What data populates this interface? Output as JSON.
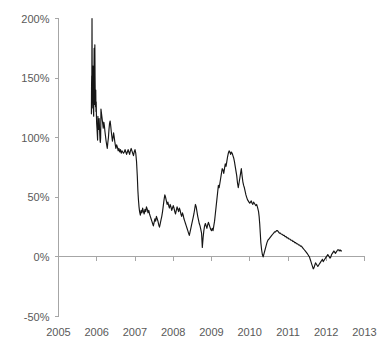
{
  "chart_data": {
    "type": "line",
    "title": "",
    "subtitle": "",
    "xlabel": "",
    "ylabel": "",
    "grid": false,
    "legend": "none",
    "legend_entries": [],
    "annotations": [],
    "line_color": "#161616",
    "axis_color": "#a6a6a6",
    "tick_label_color": "#595959",
    "xlim": [
      2005,
      2013
    ],
    "ylim": [
      -50,
      200
    ],
    "y_ticks": [
      -50,
      0,
      50,
      100,
      150,
      200
    ],
    "y_tick_labels": [
      "-50%",
      "0%",
      "50%",
      "100%",
      "150%",
      "200%"
    ],
    "x_ticks": [
      2005,
      2006,
      2007,
      2008,
      2009,
      2010,
      2011,
      2012,
      2013
    ],
    "x_tick_labels": [
      "2005",
      "2006",
      "2007",
      "2008",
      "2009",
      "2010",
      "2011",
      "2012",
      "2013"
    ],
    "series": [
      {
        "name": "spread",
        "x": [
          2005.86,
          2005.864,
          2005.868,
          2005.872,
          2005.876,
          2005.88,
          2005.884,
          2005.89,
          2005.896,
          2005.902,
          2005.908,
          2005.914,
          2005.92,
          2005.926,
          2005.932,
          2005.938,
          2005.944,
          2005.95,
          2005.956,
          2005.962,
          2005.968,
          2005.974,
          2005.98,
          2005.986,
          2005.992,
          2005.998,
          2006.006,
          2006.014,
          2006.022,
          2006.03,
          2006.038,
          2006.046,
          2006.054,
          2006.062,
          2006.07,
          2006.078,
          2006.086,
          2006.094,
          2006.102,
          2006.11,
          2006.125,
          2006.14,
          2006.155,
          2006.17,
          2006.185,
          2006.2,
          2006.215,
          2006.23,
          2006.245,
          2006.26,
          2006.275,
          2006.29,
          2006.305,
          2006.32,
          2006.335,
          2006.35,
          2006.365,
          2006.38,
          2006.395,
          2006.41,
          2006.425,
          2006.44,
          2006.455,
          2006.47,
          2006.485,
          2006.5,
          2006.52,
          2006.54,
          2006.56,
          2006.58,
          2006.6,
          2006.62,
          2006.64,
          2006.66,
          2006.68,
          2006.7,
          2006.72,
          2006.74,
          2006.76,
          2006.78,
          2006.8,
          2006.82,
          2006.84,
          2006.86,
          2006.88,
          2006.9,
          2006.92,
          2006.94,
          2006.96,
          2006.98,
          2007.0,
          2007.02,
          2007.04,
          2007.06,
          2007.075,
          2007.09,
          2007.105,
          2007.12,
          2007.14,
          2007.16,
          2007.18,
          2007.2,
          2007.22,
          2007.24,
          2007.26,
          2007.28,
          2007.3,
          2007.32,
          2007.34,
          2007.36,
          2007.38,
          2007.4,
          2007.42,
          2007.44,
          2007.46,
          2007.48,
          2007.5,
          2007.52,
          2007.54,
          2007.56,
          2007.58,
          2007.6,
          2007.62,
          2007.64,
          2007.66,
          2007.68,
          2007.7,
          2007.72,
          2007.74,
          2007.76,
          2007.78,
          2007.8,
          2007.82,
          2007.84,
          2007.86,
          2007.88,
          2007.9,
          2007.92,
          2007.94,
          2007.96,
          2007.98,
          2008.0,
          2008.02,
          2008.04,
          2008.06,
          2008.08,
          2008.1,
          2008.12,
          2008.14,
          2008.16,
          2008.18,
          2008.2,
          2008.22,
          2008.24,
          2008.26,
          2008.28,
          2008.3,
          2008.32,
          2008.34,
          2008.36,
          2008.38,
          2008.4,
          2008.42,
          2008.44,
          2008.46,
          2008.48,
          2008.5,
          2008.52,
          2008.54,
          2008.56,
          2008.58,
          2008.6,
          2008.62,
          2008.64,
          2008.66,
          2008.68,
          2008.7,
          2008.72,
          2008.74,
          2008.76,
          2008.78,
          2008.8,
          2008.82,
          2008.84,
          2008.86,
          2008.88,
          2008.9,
          2008.92,
          2008.94,
          2008.96,
          2008.98,
          2009.0,
          2009.02,
          2009.04,
          2009.06,
          2009.08,
          2009.1,
          2009.12,
          2009.14,
          2009.16,
          2009.18,
          2009.2,
          2009.22,
          2009.24,
          2009.26,
          2009.28,
          2009.3,
          2009.32,
          2009.34,
          2009.36,
          2009.38,
          2009.4,
          2009.42,
          2009.44,
          2009.46,
          2009.48,
          2009.5,
          2009.52,
          2009.54,
          2009.56,
          2009.58,
          2009.6,
          2009.62,
          2009.64,
          2009.66,
          2009.68,
          2009.7,
          2009.72,
          2009.74,
          2009.76,
          2009.78,
          2009.8,
          2009.82,
          2009.84,
          2009.86,
          2009.88,
          2009.9,
          2009.92,
          2009.94,
          2009.96,
          2009.98,
          2010.0,
          2010.02,
          2010.04,
          2010.06,
          2010.08,
          2010.1,
          2010.12,
          2010.14,
          2010.16,
          2010.18,
          2010.2,
          2010.215,
          2010.23,
          2010.245,
          2010.26,
          2010.275,
          2010.29,
          2010.31,
          2010.33,
          2010.35,
          2010.375,
          2010.4,
          2010.425,
          2010.45,
          2010.475,
          2010.5,
          2010.525,
          2010.55,
          2010.575,
          2010.6,
          2010.625,
          2010.65,
          2010.675,
          2010.7,
          2010.725,
          2010.75,
          2010.775,
          2010.8,
          2010.825,
          2010.85,
          2010.875,
          2010.9,
          2010.925,
          2010.95,
          2010.975,
          2011.0,
          2011.025,
          2011.05,
          2011.075,
          2011.1,
          2011.125,
          2011.15,
          2011.175,
          2011.2,
          2011.225,
          2011.25,
          2011.275,
          2011.3,
          2011.325,
          2011.35,
          2011.375,
          2011.4,
          2011.425,
          2011.45,
          2011.475,
          2011.5,
          2011.52,
          2011.54,
          2011.56,
          2011.58,
          2011.6,
          2011.62,
          2011.64,
          2011.66,
          2011.68,
          2011.7,
          2011.72,
          2011.74,
          2011.76,
          2011.78,
          2011.8,
          2011.82,
          2011.84,
          2011.86,
          2011.88,
          2011.9,
          2011.92,
          2011.94,
          2011.96,
          2011.98,
          2012.0,
          2012.02,
          2012.04,
          2012.06,
          2012.08,
          2012.1,
          2012.12,
          2012.14,
          2012.16,
          2012.18,
          2012.2,
          2012.22,
          2012.24,
          2012.26,
          2012.28,
          2012.3,
          2012.32,
          2012.34,
          2012.36,
          2012.38,
          2012.4
        ],
        "values": [
          120,
          143,
          152,
          148,
          200,
          160,
          150,
          131,
          125,
          160,
          133,
          122,
          118,
          150,
          175,
          140,
          128,
          178,
          150,
          132,
          126,
          140,
          122,
          130,
          118,
          112,
          108,
          103,
          98,
          118,
          110,
          107,
          112,
          116,
          110,
          104,
          98,
          96,
          100,
          124,
          120,
          116,
          112,
          108,
          113,
          110,
          105,
          101,
          97,
          94,
          91,
          96,
          100,
          107,
          112,
          114,
          110,
          105,
          101,
          97,
          100,
          104,
          101,
          97,
          94,
          91,
          94,
          92,
          89,
          91,
          88,
          90,
          87,
          89,
          88,
          87,
          88,
          90,
          88,
          86,
          88,
          90,
          88,
          86,
          89,
          91,
          89,
          87,
          85,
          88,
          90,
          87,
          80,
          68,
          56,
          48,
          42,
          38,
          35,
          39,
          37,
          41,
          38,
          36,
          40,
          38,
          42,
          40,
          37,
          39,
          36,
          34,
          32,
          30,
          28,
          26,
          29,
          32,
          30,
          34,
          32,
          30,
          27,
          25,
          28,
          31,
          34,
          38,
          43,
          48,
          52,
          50,
          47,
          44,
          46,
          43,
          41,
          44,
          42,
          39,
          41,
          43,
          41,
          38,
          36,
          39,
          42,
          40,
          38,
          41,
          39,
          36,
          34,
          37,
          35,
          32,
          30,
          28,
          26,
          24,
          22,
          20,
          18,
          21,
          24,
          27,
          30,
          33,
          36,
          40,
          44,
          42,
          38,
          34,
          31,
          28,
          26,
          23,
          20,
          8,
          16,
          22,
          26,
          28,
          26,
          24,
          27,
          29,
          27,
          25,
          23,
          22,
          24,
          22,
          26,
          30,
          36,
          42,
          48,
          54,
          60,
          58,
          62,
          66,
          70,
          74,
          73,
          70,
          74,
          78,
          76,
          80,
          84,
          87,
          89,
          88,
          86,
          88,
          87,
          85,
          83,
          80,
          76,
          72,
          68,
          62,
          58,
          62,
          66,
          70,
          74,
          68,
          63,
          60,
          58,
          55,
          52,
          50,
          48,
          47,
          46,
          45,
          46,
          47,
          45,
          44,
          46,
          45,
          44,
          43,
          44,
          42,
          40,
          38,
          34,
          28,
          20,
          12,
          6,
          2,
          0,
          3,
          6,
          9,
          12,
          14,
          15,
          16,
          17,
          18,
          19,
          20,
          21,
          21,
          22,
          22,
          21,
          20,
          20,
          19,
          19,
          18,
          18,
          17,
          17,
          16,
          16,
          15,
          15,
          14,
          14,
          13,
          13,
          12,
          12,
          11,
          11,
          10,
          10,
          9,
          9,
          8,
          7,
          6,
          5,
          4,
          3,
          2,
          1,
          0,
          -2,
          -4,
          -6,
          -8,
          -10,
          -9,
          -7,
          -5,
          -6,
          -7,
          -8,
          -7,
          -6,
          -5,
          -4,
          -3,
          -2,
          -4,
          -3,
          -2,
          -1,
          0,
          1,
          2,
          1,
          0,
          -1,
          0,
          2,
          3,
          4,
          5,
          4,
          3,
          4,
          5,
          6,
          6,
          5,
          6,
          5,
          5
        ]
      }
    ]
  }
}
